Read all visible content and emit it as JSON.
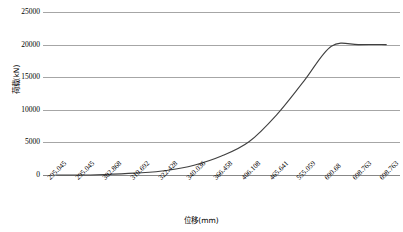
{
  "chart_data": {
    "type": "line",
    "title": "",
    "xlabel": "位移(mm)",
    "ylabel": "荷载(kN)",
    "ylim": [
      0,
      25000
    ],
    "y_ticks": [
      0,
      5000,
      10000,
      15000,
      20000,
      25000
    ],
    "y_tick_labels": [
      "0",
      "5000",
      "10000",
      "15000",
      "20000",
      "25000"
    ],
    "grid": true,
    "legend": "none",
    "categories": [
      "295.045",
      "295.045",
      "302.868",
      "310.692",
      "322.428",
      "340.036",
      "366.458",
      "406.108",
      "465.641",
      "555.059",
      "690.68",
      "698.763",
      "698.763"
    ],
    "x": [
      295.045,
      295.045,
      302.868,
      310.692,
      322.428,
      340.036,
      366.458,
      406.108,
      465.641,
      555.059,
      690.68,
      698.763,
      698.763
    ],
    "series": [
      {
        "name": "荷载-位移曲线",
        "color": "#404040",
        "values": [
          0,
          0,
          120,
          320,
          700,
          1500,
          2900,
          5100,
          9200,
          14400,
          19750,
          20000,
          20000
        ]
      }
    ]
  },
  "axes": {
    "y_title": "荷载(kN)",
    "x_title": "位移(mm)"
  }
}
